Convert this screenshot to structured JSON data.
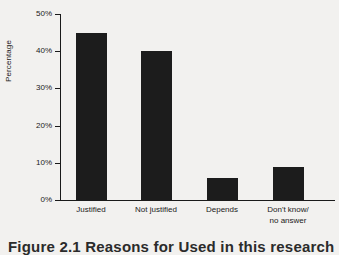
{
  "chart_data": {
    "type": "bar",
    "title": "",
    "xlabel": "",
    "ylabel": "Percentage",
    "categories": [
      "Justified",
      "Not justified",
      "Depends",
      "Don't know/\nno answer"
    ],
    "values": [
      45,
      40,
      6,
      9
    ],
    "ylim": [
      0,
      50
    ],
    "yticks": [
      0,
      10,
      20,
      30,
      40,
      50
    ],
    "ytick_labels": [
      "0%",
      "10%",
      "20%",
      "30%",
      "40%",
      "50%"
    ],
    "grid": false,
    "legend": false,
    "bar_color": "#1c1c1c",
    "background_color": "#f2f1ef",
    "axis_color": "#1a1a1a"
  },
  "caption": {
    "text": "Figure 2.1 Reasons for Used in this research"
  }
}
